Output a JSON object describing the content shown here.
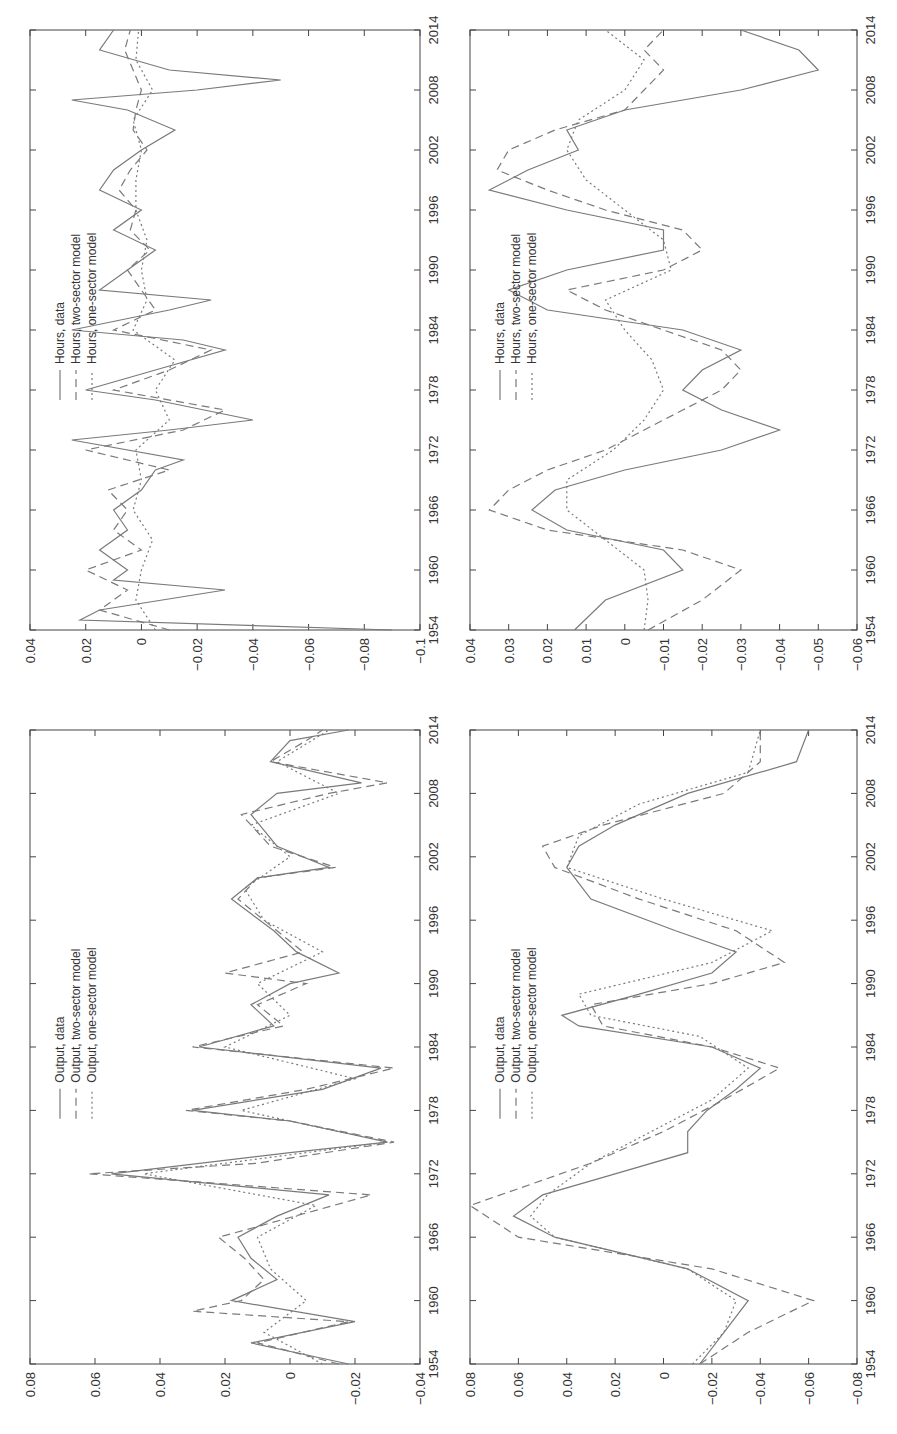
{
  "figure": {
    "orientation": "rotated-90-ccw",
    "line_color": "#7a7a7a",
    "axis_color": "#444444"
  },
  "chart_data": [
    {
      "id": "output-raw",
      "type": "line",
      "title": "",
      "xlabel": "",
      "ylabel": "",
      "x_ticks": [
        "1954",
        "1960",
        "1966",
        "1972",
        "1978",
        "1984",
        "1990",
        "1996",
        "2002",
        "2008",
        "2014"
      ],
      "y_ticks": [
        "0.08",
        "0.06",
        "0.04",
        "0.02",
        "0",
        "-0.02",
        "-0.04"
      ],
      "xlim": [
        1954,
        2014
      ],
      "ylim": [
        -0.04,
        0.08
      ],
      "legend": [
        "Output, data",
        "Output, two-sector model",
        "Output, one-sector model"
      ],
      "series": [
        {
          "name": "Output, data",
          "style": "solid",
          "x": [
            1954,
            1956,
            1958,
            1960,
            1962,
            1964,
            1966,
            1968,
            1970,
            1972,
            1974,
            1975,
            1977,
            1978,
            1980,
            1982,
            1984,
            1986,
            1988,
            1990,
            1991,
            1993,
            1995,
            1998,
            2000,
            2001,
            2003,
            2006,
            2008,
            2009,
            2011,
            2013,
            2014
          ],
          "values": [
            -0.018,
            0.012,
            -0.02,
            0.018,
            0.004,
            0.012,
            0.016,
            0.004,
            -0.012,
            0.055,
            0.0,
            -0.03,
            0.0,
            0.03,
            -0.01,
            -0.028,
            0.028,
            0.005,
            0.012,
            0.0,
            -0.015,
            -0.002,
            0.005,
            0.018,
            0.01,
            -0.012,
            0.004,
            0.012,
            0.004,
            -0.022,
            0.006,
            0.0,
            -0.018
          ]
        },
        {
          "name": "Output, two-sector model",
          "style": "dashed",
          "x": [
            1954,
            1956,
            1958,
            1959,
            1960,
            1962,
            1964,
            1966,
            1967,
            1970,
            1972,
            1973,
            1975,
            1977,
            1978,
            1980,
            1982,
            1984,
            1986,
            1988,
            1990,
            1991,
            1993,
            1995,
            1998,
            2000,
            2001,
            2003,
            2006,
            2008,
            2009,
            2011,
            2013,
            2014
          ],
          "values": [
            -0.015,
            0.01,
            -0.018,
            0.03,
            0.015,
            0.008,
            0.014,
            0.022,
            0.01,
            -0.025,
            0.062,
            0.01,
            -0.032,
            0.0,
            0.032,
            -0.005,
            -0.032,
            0.03,
            0.002,
            0.01,
            -0.005,
            0.02,
            -0.004,
            0.004,
            0.016,
            0.01,
            -0.014,
            0.006,
            0.015,
            -0.012,
            -0.03,
            0.006,
            -0.005,
            -0.01
          ]
        },
        {
          "name": "Output, one-sector model",
          "style": "dotted",
          "x": [
            1954,
            1957,
            1960,
            1963,
            1966,
            1969,
            1972,
            1975,
            1978,
            1981,
            1984,
            1987,
            1990,
            1993,
            1996,
            1999,
            2002,
            2005,
            2008,
            2011,
            2014
          ],
          "values": [
            -0.01,
            0.008,
            -0.005,
            0.006,
            0.01,
            -0.008,
            0.045,
            -0.03,
            0.015,
            -0.02,
            0.02,
            0.0,
            0.01,
            -0.01,
            0.008,
            0.014,
            0.0,
            0.012,
            -0.015,
            0.004,
            -0.012
          ]
        }
      ]
    },
    {
      "id": "hours-raw",
      "type": "line",
      "title": "",
      "xlabel": "",
      "ylabel": "",
      "x_ticks": [
        "1954",
        "1960",
        "1966",
        "1972",
        "1978",
        "1984",
        "1990",
        "1996",
        "2002",
        "2008",
        "2014"
      ],
      "y_ticks": [
        "0.04",
        "0.02",
        "0",
        "-0.02",
        "-0.04",
        "-0.06",
        "-0.08",
        "-0.1"
      ],
      "xlim": [
        1954,
        2014
      ],
      "ylim": [
        -0.1,
        0.04
      ],
      "legend": [
        "Hours, data",
        "Hours, two-sector model",
        "Hours, one-sector model"
      ],
      "series": [
        {
          "name": "Hours, data",
          "style": "solid",
          "x": [
            1954,
            1955,
            1956,
            1958,
            1959,
            1960,
            1962,
            1964,
            1966,
            1968,
            1970,
            1971,
            1973,
            1974,
            1975,
            1977,
            1978,
            1980,
            1982,
            1983,
            1984,
            1986,
            1987,
            1988,
            1990,
            1992,
            1994,
            1996,
            1998,
            2000,
            2002,
            2004,
            2006,
            2007,
            2008,
            2009,
            2010,
            2012,
            2014
          ],
          "values": [
            -0.09,
            0.022,
            0.015,
            -0.03,
            0.01,
            0.005,
            0.015,
            0.005,
            0.01,
            0.0,
            -0.005,
            -0.015,
            0.025,
            -0.01,
            -0.04,
            -0.005,
            0.02,
            -0.005,
            -0.03,
            -0.015,
            0.025,
            -0.01,
            -0.025,
            0.015,
            0.005,
            -0.005,
            0.01,
            0.0,
            0.015,
            0.01,
            0.0,
            -0.012,
            0.005,
            0.025,
            -0.02,
            -0.05,
            -0.01,
            0.015,
            0.01
          ]
        },
        {
          "name": "Hours, two-sector model",
          "style": "dashed",
          "x": [
            1954,
            1956,
            1958,
            1960,
            1962,
            1964,
            1966,
            1968,
            1970,
            1972,
            1974,
            1976,
            1978,
            1980,
            1982,
            1984,
            1986,
            1988,
            1990,
            1992,
            1994,
            1996,
            1998,
            2000,
            2002,
            2004,
            2006,
            2008,
            2010,
            2012,
            2014
          ],
          "values": [
            -0.01,
            0.015,
            0.005,
            0.02,
            0.0,
            0.01,
            0.005,
            0.012,
            -0.01,
            0.02,
            -0.015,
            -0.03,
            0.01,
            -0.01,
            -0.025,
            0.01,
            -0.005,
            0.0,
            0.005,
            -0.003,
            0.004,
            0.002,
            0.008,
            0.004,
            -0.002,
            0.003,
            0.002,
            0.0,
            0.003,
            0.006,
            0.004
          ]
        },
        {
          "name": "Hours, one-sector model",
          "style": "dotted",
          "x": [
            1954,
            1957,
            1960,
            1963,
            1966,
            1969,
            1972,
            1975,
            1978,
            1981,
            1984,
            1987,
            1990,
            1993,
            1996,
            1999,
            2002,
            2005,
            2008,
            2011,
            2014
          ],
          "values": [
            -0.005,
            0.002,
            0.0,
            -0.004,
            0.003,
            0.0,
            0.002,
            -0.01,
            -0.005,
            -0.012,
            0.003,
            -0.002,
            0.0,
            -0.002,
            0.002,
            0.002,
            0.0,
            0.003,
            -0.004,
            0.002,
            0.001
          ]
        }
      ]
    },
    {
      "id": "output-smoothed",
      "type": "line",
      "title": "",
      "xlabel": "",
      "ylabel": "",
      "x_ticks": [
        "1954",
        "1960",
        "1966",
        "1972",
        "1978",
        "1984",
        "1990",
        "1996",
        "2002",
        "2008",
        "2014"
      ],
      "y_ticks": [
        "0.08",
        "0.06",
        "0.04",
        "0.02",
        "0",
        "-0.02",
        "-0.04",
        "-0.06",
        "-0.08"
      ],
      "xlim": [
        1954,
        2014
      ],
      "ylim": [
        -0.08,
        0.08
      ],
      "legend": [
        "Output, data",
        "Output, two-sector model",
        "Output, one-sector model"
      ],
      "series": [
        {
          "name": "Output, data",
          "style": "solid",
          "x": [
            1954,
            1957,
            1960,
            1963,
            1966,
            1968,
            1970,
            1972,
            1974,
            1976,
            1978,
            1980,
            1982,
            1984,
            1986,
            1987,
            1989,
            1991,
            1993,
            1995,
            1998,
            2001,
            2003,
            2005,
            2008,
            2011,
            2014
          ],
          "values": [
            -0.015,
            -0.025,
            -0.035,
            -0.01,
            0.045,
            0.062,
            0.05,
            0.02,
            -0.01,
            -0.01,
            -0.018,
            -0.03,
            -0.04,
            -0.02,
            0.035,
            0.042,
            0.01,
            -0.02,
            -0.03,
            -0.005,
            0.03,
            0.04,
            0.035,
            0.02,
            -0.01,
            -0.055,
            -0.06
          ]
        },
        {
          "name": "Output, two-sector model",
          "style": "dashed",
          "x": [
            1954,
            1957,
            1960,
            1963,
            1966,
            1969,
            1971,
            1973,
            1976,
            1979,
            1982,
            1984,
            1986,
            1988,
            1990,
            1992,
            1995,
            1998,
            2001,
            2003,
            2005,
            2008,
            2011,
            2014
          ],
          "values": [
            -0.015,
            -0.035,
            -0.062,
            -0.02,
            0.06,
            0.08,
            0.055,
            0.03,
            0.0,
            -0.025,
            -0.048,
            -0.02,
            0.025,
            0.03,
            -0.02,
            -0.05,
            -0.03,
            0.01,
            0.045,
            0.05,
            0.025,
            -0.025,
            -0.04,
            -0.04
          ]
        },
        {
          "name": "Output, one-sector model",
          "style": "dotted",
          "x": [
            1954,
            1957,
            1960,
            1963,
            1966,
            1968,
            1970,
            1973,
            1976,
            1979,
            1982,
            1985,
            1987,
            1989,
            1992,
            1995,
            1998,
            2001,
            2004,
            2007,
            2010,
            2014
          ],
          "values": [
            -0.012,
            -0.025,
            -0.03,
            -0.01,
            0.045,
            0.055,
            0.048,
            0.03,
            0.005,
            -0.02,
            -0.035,
            -0.015,
            0.03,
            0.035,
            -0.02,
            -0.045,
            0.0,
            0.04,
            0.035,
            0.01,
            -0.035,
            -0.04
          ]
        }
      ]
    },
    {
      "id": "hours-smoothed",
      "type": "line",
      "title": "",
      "xlabel": "",
      "ylabel": "",
      "x_ticks": [
        "1954",
        "1960",
        "1966",
        "1972",
        "1978",
        "1984",
        "1990",
        "1996",
        "2002",
        "2008",
        "2014"
      ],
      "y_ticks": [
        "0.04",
        "0.03",
        "0.02",
        "0.01",
        "0",
        "-0.01",
        "-0.02",
        "-0.03",
        "-0.04",
        "-0.05",
        "-0.06"
      ],
      "xlim": [
        1954,
        2014
      ],
      "ylim": [
        -0.06,
        0.04
      ],
      "legend": [
        "Hours, data",
        "Hours, two-sector model",
        "Hours, one-sector model"
      ],
      "series": [
        {
          "name": "Hours, data",
          "style": "solid",
          "x": [
            1954,
            1957,
            1960,
            1962,
            1964,
            1966,
            1968,
            1970,
            1972,
            1974,
            1976,
            1978,
            1980,
            1982,
            1984,
            1986,
            1988,
            1990,
            1992,
            1994,
            1996,
            1998,
            2000,
            2002,
            2004,
            2006,
            2008,
            2010,
            2012,
            2014
          ],
          "values": [
            0.013,
            0.005,
            -0.015,
            -0.01,
            0.015,
            0.024,
            0.018,
            0.0,
            -0.025,
            -0.04,
            -0.025,
            -0.015,
            -0.02,
            -0.03,
            -0.015,
            0.02,
            0.03,
            0.015,
            -0.01,
            -0.01,
            0.015,
            0.035,
            0.025,
            0.012,
            0.015,
            0.0,
            -0.03,
            -0.05,
            -0.045,
            -0.03
          ]
        },
        {
          "name": "Hours, two-sector model",
          "style": "dashed",
          "x": [
            1954,
            1957,
            1960,
            1962,
            1964,
            1966,
            1968,
            1970,
            1972,
            1974,
            1976,
            1978,
            1980,
            1982,
            1984,
            1986,
            1988,
            1990,
            1992,
            1994,
            1996,
            1998,
            2000,
            2002,
            2004,
            2006,
            2008,
            2010,
            2012,
            2014
          ],
          "values": [
            -0.006,
            -0.02,
            -0.03,
            -0.015,
            0.02,
            0.035,
            0.03,
            0.02,
            0.005,
            -0.005,
            -0.015,
            -0.025,
            -0.03,
            -0.025,
            -0.01,
            0.005,
            0.015,
            -0.01,
            -0.02,
            -0.015,
            0.005,
            0.02,
            0.033,
            0.03,
            0.018,
            0.0,
            -0.005,
            -0.01,
            -0.005,
            -0.01
          ]
        },
        {
          "name": "Hours, one-sector model",
          "style": "dotted",
          "x": [
            1954,
            1957,
            1960,
            1963,
            1966,
            1969,
            1972,
            1975,
            1978,
            1981,
            1984,
            1987,
            1990,
            1993,
            1996,
            1999,
            2002,
            2005,
            2008,
            2011,
            2014
          ],
          "values": [
            -0.005,
            -0.006,
            -0.005,
            0.005,
            0.015,
            0.015,
            0.003,
            -0.005,
            -0.01,
            -0.007,
            -0.0,
            0.005,
            -0.012,
            -0.01,
            0.0,
            0.01,
            0.015,
            0.012,
            0.0,
            -0.005,
            0.005
          ]
        }
      ]
    }
  ]
}
